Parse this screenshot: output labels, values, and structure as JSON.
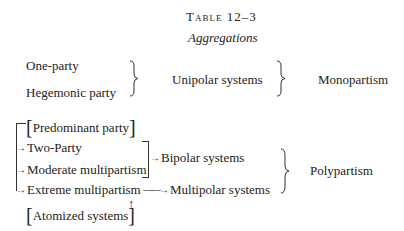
{
  "table": {
    "title": "Table 12–3",
    "subtitle": "Aggregations"
  },
  "upper_group": {
    "items": [
      "One-party",
      "Hegemonic party"
    ],
    "aggregate": "Unipolar systems",
    "category": "Monopartism"
  },
  "lower_group": {
    "predominant": "Predominant party",
    "two_party": "Two-Party",
    "moderate": "Moderate multipartism",
    "bipolar": "Bipolar systems",
    "extreme": "Extreme multipartism",
    "multipolar": "Multipolar systems",
    "atomized": "Atomized systems",
    "category": "Polypartism"
  },
  "symbols": {
    "arrow": "→",
    "long_arrow": "——→",
    "up_arrow": "↑",
    "left_bracket": "[",
    "right_bracket": "]"
  }
}
